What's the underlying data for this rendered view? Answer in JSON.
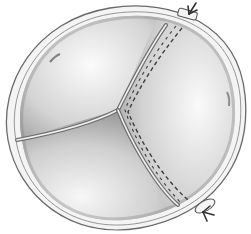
{
  "illustration": {
    "subject": "tricuspid valve with sutured commissure",
    "colors": {
      "background": "#ffffff",
      "ring_stroke": "#6a6a6a",
      "leaflet_light": "#f2f2f2",
      "leaflet_dark": "#9a9a9a",
      "suture": "#444444"
    },
    "elements": [
      "annulus-ring",
      "leaflets",
      "commissure-lines",
      "suture-line",
      "pledget-top",
      "pledget-bottom",
      "arrow-top",
      "arrow-bottom"
    ]
  }
}
